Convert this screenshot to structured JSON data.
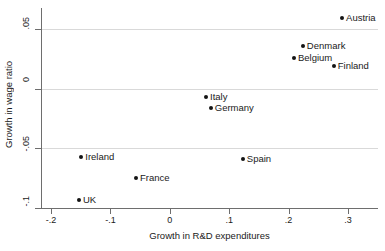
{
  "chart_data": {
    "type": "scatter",
    "title": "",
    "xlabel": "Growth in R&D expenditures",
    "ylabel": "Growth in wage ratio",
    "xlim": [
      -0.21,
      0.325
    ],
    "ylim": [
      -0.103,
      0.067
    ],
    "xticks": [
      -0.2,
      -0.1,
      0,
      0.1,
      0.2,
      0.3
    ],
    "xticklabels": [
      "-.2",
      "-.1",
      "0",
      ".1",
      ".2",
      ".3"
    ],
    "yticks": [
      0.05,
      0,
      -0.05,
      -0.1
    ],
    "yticklabels": [
      ".05",
      "0",
      "-.05",
      "-.1"
    ],
    "grid": "horizontal",
    "legend": "none",
    "points": [
      {
        "label": "Austria",
        "x": 0.29,
        "y": 0.059,
        "label_side": "right"
      },
      {
        "label": "Denmark",
        "x": 0.224,
        "y": 0.036,
        "label_side": "right"
      },
      {
        "label": "Belgium",
        "x": 0.209,
        "y": 0.026,
        "label_side": "right"
      },
      {
        "label": "Finland",
        "x": 0.276,
        "y": 0.019,
        "label_side": "right"
      },
      {
        "label": "Italy",
        "x": 0.061,
        "y": -0.007,
        "label_side": "right"
      },
      {
        "label": "Germany",
        "x": 0.069,
        "y": -0.016,
        "label_side": "right"
      },
      {
        "label": "Ireland",
        "x": -0.149,
        "y": -0.057,
        "label_side": "right"
      },
      {
        "label": "Spain",
        "x": 0.123,
        "y": -0.059,
        "label_side": "right"
      },
      {
        "label": "France",
        "x": -0.057,
        "y": -0.075,
        "label_side": "right"
      },
      {
        "label": "UK",
        "x": -0.153,
        "y": -0.093,
        "label_side": "right"
      }
    ],
    "colors": {
      "marker": "#141414",
      "grid": "#d9d9d9",
      "axis": "#6e6e6e",
      "text": "#1a1a1a",
      "background": "#ffffff"
    }
  }
}
